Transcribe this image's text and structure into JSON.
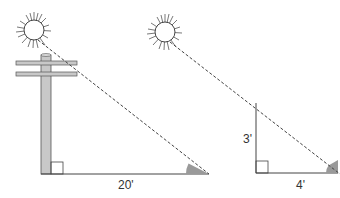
{
  "diagram": {
    "colors": {
      "line": "#444444",
      "pole_fill": "#c8c8c8",
      "angle_fill": "#9a9a9a",
      "background": "#ffffff"
    },
    "left_figure": {
      "object": "telephone pole",
      "shadow_label": "20'"
    },
    "right_figure": {
      "object": "stick",
      "height_label": "3'",
      "shadow_label": "4'"
    },
    "icons": [
      "sun-icon",
      "sun-icon"
    ]
  }
}
